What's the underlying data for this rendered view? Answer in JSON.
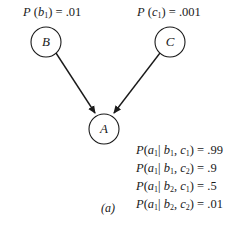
{
  "diagram": {
    "type": "bayesian-network",
    "nodes": [
      {
        "id": "B",
        "label": "B",
        "prior": {
          "var": "b",
          "sub": "1",
          "value": ".01"
        }
      },
      {
        "id": "C",
        "label": "C",
        "prior": {
          "var": "c",
          "sub": "1",
          "value": ".001"
        }
      },
      {
        "id": "A",
        "label": "A"
      }
    ],
    "edges": [
      {
        "from": "B",
        "to": "A"
      },
      {
        "from": "C",
        "to": "A"
      }
    ],
    "cpt": [
      {
        "b": "1",
        "c": "1",
        "value": ".99"
      },
      {
        "b": "1",
        "c": "2",
        "value": ".9"
      },
      {
        "b": "2",
        "c": "1",
        "value": ".5"
      },
      {
        "b": "2",
        "c": "2",
        "value": ".01"
      }
    ],
    "caption": "(a)"
  },
  "text": {
    "P": "P",
    "open": "(",
    "close": ")",
    "eq": " = ",
    "a": "a",
    "a_sub": "1",
    "bar": "| ",
    "b": "b",
    "c": "c",
    "comma": ", "
  }
}
